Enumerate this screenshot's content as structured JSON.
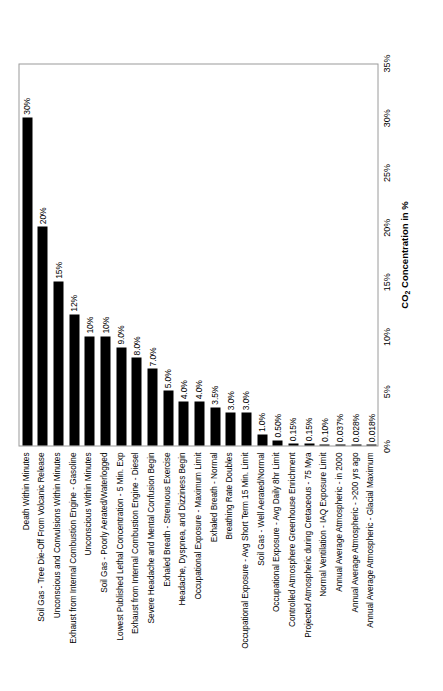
{
  "chart_data": {
    "type": "bar",
    "orientation": "vertical-rotated",
    "title": "",
    "subtitle": "",
    "xlabel": "CO2 Concentration in %",
    "xlabel_html": "CO<sub>2</sub> Concentration in %",
    "ylabel": "",
    "xlim": [
      0,
      35
    ],
    "xticks": [
      "0%",
      "5%",
      "10%",
      "15%",
      "20%",
      "25%",
      "30%",
      "35%"
    ],
    "xtick_values": [
      0,
      5,
      10,
      15,
      20,
      25,
      30,
      35
    ],
    "grid": false,
    "legend": false,
    "bar_color": "#000000",
    "categories": [
      "Death Within Minutes",
      "Soil Gas - Tree Die-Off From Volcanic Release",
      "Unconscious and Convulsions Within Minutes",
      "Exhaust from Internal Combustion Engine - Gasoline",
      "Unconscious Within Minutes",
      "Soil Gas - Poorly Aerated/Waterlogged",
      "Lowest Published Lethal Concentration - 5 Min. Exp",
      "Exhaust from Internal Combustion Engine - Diesel",
      "Severe Headache and Mental Confusion Begin",
      "Exhaled Breath - Strenuous Exercise",
      "Headache, Dyspnea, and Dizziness Begin",
      "Occupational Exposure - Maximum Limit",
      "Exhaled Breath - Normal",
      "Breathing Rate Doubles",
      "Occupational Exposure - Avg Short Term 15 Min. Limit",
      "Soil Gas - Well Aerated/Normal",
      "Occupational Exposure - Avg Daily 8hr Limit",
      "Controlled Atmosphere Greenhouse Enrichment",
      "Projected Atmospheric during Cretaceous - 75 Mya",
      "Normal Ventilation - IAQ Exposure Limit",
      "Annual Average Atmospheric - in 2000",
      "Annual Average Atmospheric - >200 yrs ago",
      "Annual Average Atmospheric - Glacial Maximum"
    ],
    "values": [
      30,
      20,
      15,
      12,
      10,
      10,
      9.0,
      8.0,
      7.0,
      5.0,
      4.0,
      4.0,
      3.5,
      3.0,
      3.0,
      1.0,
      0.5,
      0.15,
      0.15,
      0.1,
      0.037,
      0.028,
      0.018
    ],
    "value_labels": [
      "30%",
      "20%",
      "15%",
      "12%",
      "10%",
      "10%",
      "9.0%",
      "8.0%",
      "7.0%",
      "5.0%",
      "4.0%",
      "4.0%",
      "3.5%",
      "3.0%",
      "3.0%",
      "1.0%",
      "0.50%",
      "0.15%",
      "0.15%",
      "0.10%",
      "0.037%",
      "0.028%",
      "0.018%"
    ]
  }
}
